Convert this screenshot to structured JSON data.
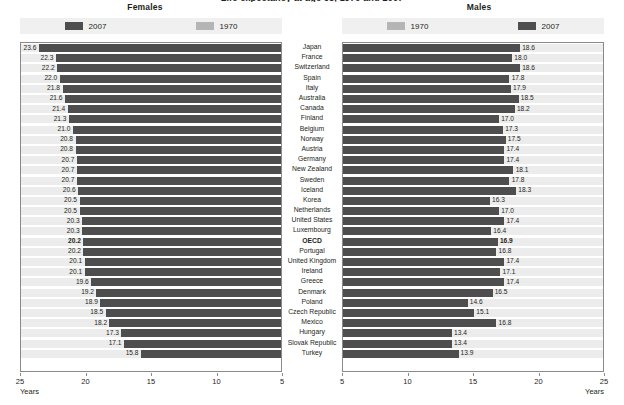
{
  "top_title": "Life expectancy at age 65, 1970 and 2007",
  "panels": {
    "females": {
      "heading": "Females",
      "legend": [
        {
          "label": "2007",
          "color": "#4e4e4e",
          "series": "2007"
        },
        {
          "label": "1970",
          "color": "#b5b5b5",
          "series": "1970"
        }
      ],
      "axis": {
        "ticks": [
          "25",
          "20",
          "15",
          "10",
          "5"
        ],
        "min": 5,
        "max": 25,
        "reversed": true,
        "unit_label": "Years"
      }
    },
    "males": {
      "heading": "Males",
      "legend": [
        {
          "label": "1970",
          "color": "#b5b5b5",
          "series": "1970"
        },
        {
          "label": "2007",
          "color": "#4e4e4e",
          "series": "2007"
        }
      ],
      "axis": {
        "ticks": [
          "5",
          "10",
          "15",
          "20",
          "25"
        ],
        "min": 5,
        "max": 25,
        "reversed": false,
        "unit_label": "Years"
      }
    }
  },
  "chart_data": {
    "type": "bar",
    "title": "Life expectancy at age 65, 1970 and 2007",
    "xlabel": "Years",
    "ylabel": "",
    "xlim": [
      5,
      25
    ],
    "grid": false,
    "legend_position": "top",
    "orientation": "horizontal-back-to-back",
    "categories": [
      "Japan",
      "France",
      "Switzerland",
      "Spain",
      "Italy",
      "Australia",
      "Canada",
      "Finland",
      "Belgium",
      "Norway",
      "Austria",
      "Germany",
      "New Zealand",
      "Sweden",
      "Iceland",
      "Korea",
      "Netherlands",
      "United States",
      "Luxembourg",
      "OECD",
      "Portugal",
      "United Kingdom",
      "Ireland",
      "Greece",
      "Denmark",
      "Poland",
      "Czech Republic",
      "Mexico",
      "Hungary",
      "Slovak Republic",
      "Turkey"
    ],
    "highlight_category": "OECD",
    "panels": [
      {
        "name": "Females",
        "series": [
          {
            "name": "2007",
            "color": "#4e4e4e",
            "values": [
              23.6,
              22.3,
              22.2,
              22.0,
              21.8,
              21.6,
              21.4,
              21.3,
              21.0,
              20.8,
              20.8,
              20.7,
              20.7,
              20.7,
              20.6,
              20.5,
              20.5,
              20.3,
              20.3,
              20.2,
              20.2,
              20.1,
              20.1,
              19.6,
              19.2,
              18.9,
              18.5,
              18.2,
              17.3,
              17.1,
              15.8
            ]
          },
          {
            "name": "1970",
            "color": "#b5b5b5",
            "values": [
              14.2,
              15.9,
              15.5,
              15.4,
              15.3,
              15.9,
              17.5,
              14.3,
              14.8,
              16.2,
              14.7,
              14.5,
              15.5,
              15.7,
              16.4,
              13.0,
              15.9,
              16.6,
              14.4,
              14.9,
              14.6,
              15.8,
              14.3,
              15.2,
              15.6,
              14.5,
              13.9,
              15.3,
              13.9,
              14.3,
              12.5
            ]
          }
        ]
      },
      {
        "name": "Males",
        "series": [
          {
            "name": "1970",
            "color": "#b5b5b5",
            "values": [
              12.5,
              13.0,
              13.3,
              13.3,
              13.3,
              12.2,
              13.7,
              11.5,
              12.1,
              13.7,
              12.2,
              12.1,
              12.8,
              13.6,
              14.6,
              10.6,
              13.5,
              13.1,
              12.4,
              12.7,
              12.5,
              12.0,
              12.4,
              13.9,
              13.5,
              12.0,
              11.1,
              14.0,
              11.6,
              11.8,
              10.6
            ]
          },
          {
            "name": "2007",
            "color": "#4e4e4e",
            "values": [
              18.6,
              18.0,
              18.6,
              17.8,
              17.9,
              18.5,
              18.2,
              17.0,
              17.3,
              17.5,
              17.4,
              17.4,
              18.1,
              17.8,
              18.3,
              16.3,
              17.0,
              17.4,
              16.4,
              16.9,
              16.8,
              17.4,
              17.1,
              17.4,
              16.5,
              14.6,
              15.1,
              16.8,
              13.4,
              13.4,
              13.9
            ]
          }
        ]
      }
    ]
  }
}
